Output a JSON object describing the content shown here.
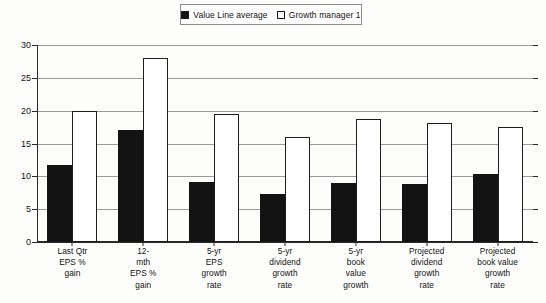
{
  "legend": {
    "entries": [
      {
        "label": "Value Line average",
        "swatch": "filled-square-icon",
        "color": "#131313"
      },
      {
        "label": "Growth manager 1",
        "swatch": "hollow-square-icon",
        "color": "#ffffff"
      }
    ]
  },
  "axis": {
    "y_ticks": [
      "0",
      "5",
      "10",
      "15",
      "20",
      "25",
      "30"
    ]
  },
  "chart_data": {
    "type": "bar",
    "title": "",
    "xlabel": "",
    "ylabel": "",
    "ylim": [
      0,
      30
    ],
    "ytick_step": 5,
    "grid": true,
    "legend_position": "top-center",
    "categories": [
      "Last Qtr\nEPS %\ngain",
      "12-\nmth\nEPS %\ngain",
      "5-yr\nEPS\ngrowth\nrate",
      "5-yr\ndividend\ngrowth\nrate",
      "5-yr\nbook\nvalue\ngrowth",
      "Projected\ndividend\ngrowth\nrate",
      "Projected\nbook value\ngrowth\nrate"
    ],
    "series": [
      {
        "name": "Value Line average",
        "color": "#131313",
        "values": [
          11.7,
          17.0,
          9.2,
          7.3,
          9.0,
          8.9,
          10.4
        ]
      },
      {
        "name": "Growth manager 1",
        "color": "#ffffff",
        "values": [
          20.0,
          28.0,
          19.5,
          16.0,
          18.7,
          18.2,
          17.5
        ]
      }
    ]
  }
}
